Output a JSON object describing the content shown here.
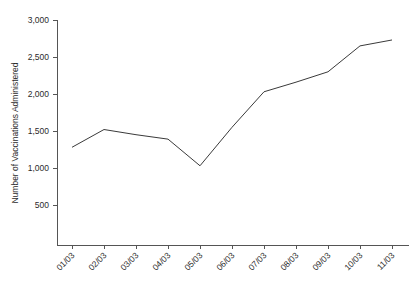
{
  "chart_data": {
    "type": "line",
    "title": "",
    "xlabel": "",
    "ylabel": "Number of Vaccinations Administered",
    "categories": [
      "01/03",
      "02/03",
      "03/03",
      "04/03",
      "05/03",
      "06/03",
      "07/03",
      "08/03",
      "09/03",
      "10/03",
      "11/03"
    ],
    "values": [
      1280,
      1520,
      1450,
      1390,
      1030,
      1550,
      2030,
      2160,
      2300,
      2650,
      2730
    ],
    "series": [
      {
        "name": "Number of Vaccinations Administered",
        "values": [
          1280,
          1520,
          1450,
          1390,
          1030,
          1550,
          2030,
          2160,
          2300,
          2650,
          2730
        ]
      }
    ],
    "ylim": [
      0,
      3000
    ],
    "ytick_values": [
      500,
      1000,
      1500,
      2000,
      2500,
      3000
    ],
    "ytick_labels": [
      "500",
      "1,000",
      "1,500",
      "2,000",
      "2,500",
      "3,000"
    ],
    "grid": false,
    "legend": false,
    "legend_position": "none",
    "line_color": "#3a3a3a",
    "axis_color": "#555555",
    "background_color": "#ffffff",
    "xtick_rotation": 45
  },
  "layout": {
    "plot_left": 57,
    "plot_right": 400,
    "plot_top": 20,
    "plot_bottom": 245,
    "y_axis_title_x": 18,
    "y_axis_title_y": 133
  }
}
